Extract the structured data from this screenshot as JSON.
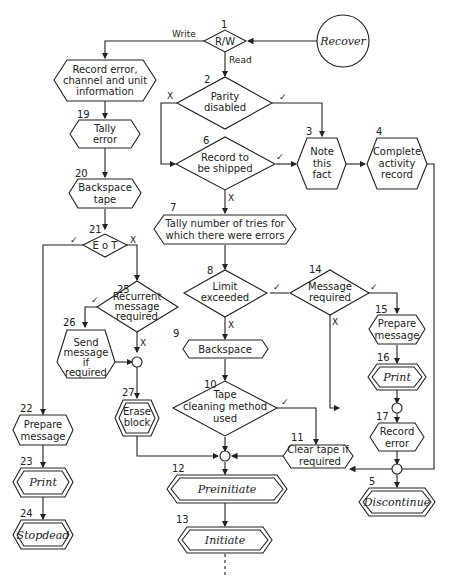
{
  "diagram": {
    "type": "flowchart",
    "start": {
      "label": "Recover"
    },
    "nodes": {
      "n1": {
        "num": "1",
        "label": "R/W",
        "shape": "decision"
      },
      "n2": {
        "num": "2",
        "lines": [
          "Parity",
          "disabled"
        ],
        "shape": "decision"
      },
      "n3": {
        "num": "3",
        "lines": [
          "Note",
          "this",
          "fact"
        ],
        "shape": "process"
      },
      "n4": {
        "num": "4",
        "lines": [
          "Complete",
          "activity",
          "record"
        ],
        "shape": "process"
      },
      "n5": {
        "num": "5",
        "label": "Discontinue",
        "shape": "terminal"
      },
      "n6": {
        "num": "6",
        "lines": [
          "Record to",
          "be shipped"
        ],
        "shape": "decision"
      },
      "n7": {
        "num": "7",
        "lines": [
          "Tally number of tries for",
          "which there were errors"
        ],
        "shape": "process"
      },
      "n8": {
        "num": "8",
        "lines": [
          "Limit",
          "exceeded"
        ],
        "shape": "decision"
      },
      "n9": {
        "num": "9",
        "label": "Backspace",
        "shape": "process"
      },
      "n10": {
        "num": "10",
        "lines": [
          "Tape",
          "cleaning method",
          "used"
        ],
        "shape": "decision"
      },
      "n11": {
        "num": "11",
        "lines": [
          "Clear tape if",
          "required"
        ],
        "shape": "process"
      },
      "n12": {
        "num": "12",
        "label": "Preinitiate",
        "shape": "terminal"
      },
      "n13": {
        "num": "13",
        "label": "Initiate",
        "shape": "terminal"
      },
      "n14": {
        "num": "14",
        "lines": [
          "Message",
          "required"
        ],
        "shape": "decision"
      },
      "n15": {
        "num": "15",
        "lines": [
          "Prepare",
          "message"
        ],
        "shape": "process"
      },
      "n16": {
        "num": "16",
        "label": "Print",
        "shape": "terminal"
      },
      "n17": {
        "num": "17",
        "lines": [
          "Record",
          "error"
        ],
        "shape": "process"
      },
      "n18": {
        "num": "",
        "lines": [
          "Record error,",
          "channel and unit",
          "information"
        ],
        "shape": "process"
      },
      "n19": {
        "num": "19",
        "lines": [
          "Tally",
          "error"
        ],
        "shape": "process"
      },
      "n20": {
        "num": "20",
        "lines": [
          "Backspace",
          "tape"
        ],
        "shape": "process"
      },
      "n21": {
        "num": "21",
        "label": "E o T",
        "shape": "decision"
      },
      "n22": {
        "num": "22",
        "lines": [
          "Prepare",
          "message"
        ],
        "shape": "process"
      },
      "n23": {
        "num": "23",
        "label": "Print",
        "shape": "terminal"
      },
      "n24": {
        "num": "24",
        "label": "Stopdead",
        "shape": "terminal"
      },
      "n25": {
        "num": "25",
        "lines": [
          "Recurrent",
          "message",
          "required"
        ],
        "shape": "decision"
      },
      "n26": {
        "num": "26",
        "lines": [
          "Send",
          "message",
          "if",
          "required"
        ],
        "shape": "process"
      },
      "n27": {
        "num": "27",
        "lines": [
          "Erase",
          "block"
        ],
        "shape": "terminal"
      }
    },
    "edge_labels": {
      "write": "Write",
      "read": "Read",
      "yes": "✓",
      "no": "X"
    }
  }
}
